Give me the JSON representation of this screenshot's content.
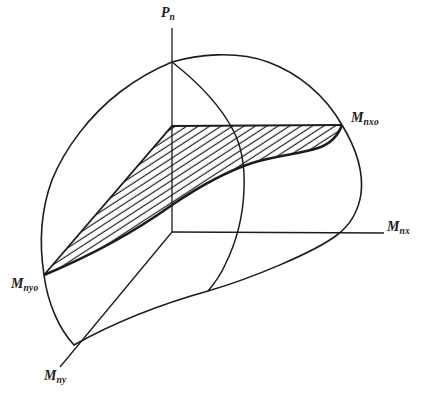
{
  "figure": {
    "background": "#ffffff",
    "line_color": "#1c1c1c",
    "labels": {
      "pn": {
        "main": "P",
        "sub": "n"
      },
      "mnx": {
        "main": "M",
        "sub": "nx"
      },
      "mny": {
        "main": "M",
        "sub": "ny"
      },
      "mnxo": {
        "main": "M",
        "sub": "nxo"
      },
      "mnyo": {
        "main": "M",
        "sub": "nyo"
      }
    }
  }
}
